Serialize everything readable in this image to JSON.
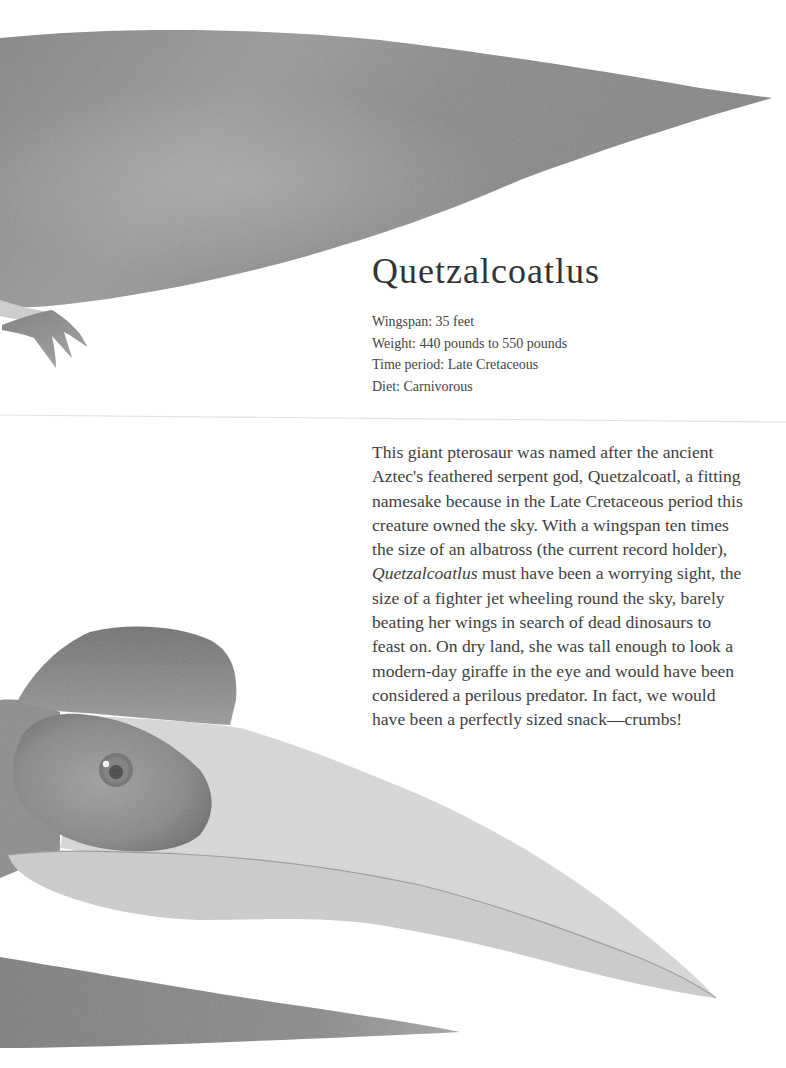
{
  "page": {
    "title": "Quetzalcoatlus",
    "facts": [
      {
        "label": "Wingspan",
        "value": "35 feet",
        "text": "Wingspan: 35 feet"
      },
      {
        "label": "Weight",
        "value": "440 pounds to 550 pounds",
        "text": "Weight: 440 pounds to 550 pounds"
      },
      {
        "label": "Time period",
        "value": "Late Cretaceous",
        "text": "Time period: Late Cretaceous"
      },
      {
        "label": "Diet",
        "value": "Carnivorous",
        "text": "Diet: Carnivorous"
      }
    ],
    "description": {
      "lines": [
        "This giant pterosaur was named after the ancient",
        "Aztec's feathered serpent god, Quetzalcoatl, a fitting",
        "namesake because in the Late Cretaceous period this",
        "creature owned the sky.  With a wingspan ten times",
        "the size of an albatross (the current record holder),",
        {
          "italic": "Quetzalcoatlus",
          "rest": " must have been a worrying sight, the"
        },
        "size of a fighter jet wheeling round the sky, barely",
        "beating her wings in search of dead dinosaurs to",
        "feast on. On dry land, she was tall enough to look a",
        "modern-day giraffe in the eye and would have been",
        "considered a perilous predator. In fact, we would",
        "have been a perfectly sized snack—crumbs!"
      ]
    },
    "illustrations": [
      {
        "name": "upper-wing",
        "description": "watercolor grey pterosaur wing with claw"
      },
      {
        "name": "quetzalcoatlus-head",
        "description": "watercolor head with crest, eye and long beak"
      },
      {
        "name": "lower-wing",
        "description": "watercolor grey wing tip at bottom"
      }
    ],
    "colors": {
      "wing_dark": "#7a7a7a",
      "wing_mid": "#8c8c8c",
      "wing_light": "#a5a5a5",
      "crest": "#858585",
      "eye_patch": "#8a8a8a",
      "beak": "#dcdcdc",
      "jaw": "#cfcfcf",
      "text": "#3e3e3e"
    }
  }
}
